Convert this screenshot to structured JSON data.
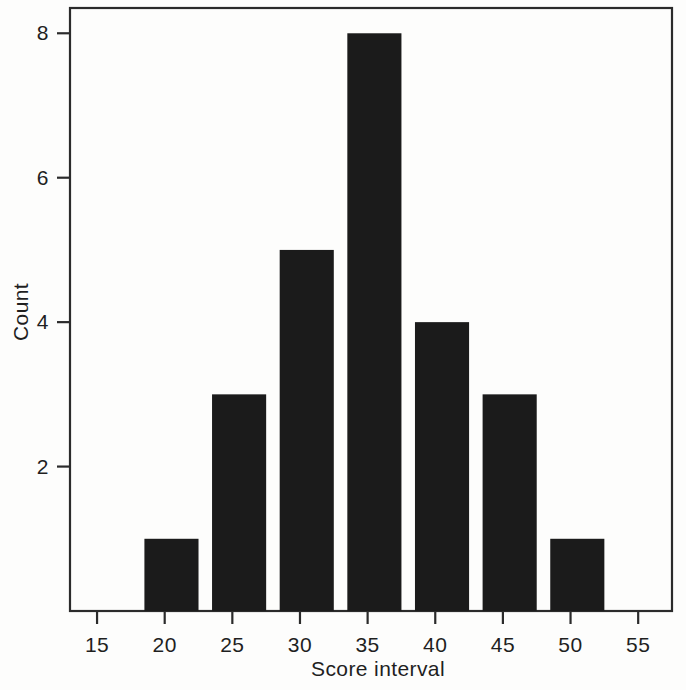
{
  "chart_data": {
    "type": "bar",
    "title": "",
    "subtitle": "",
    "xlabel": "Score interval",
    "ylabel": "Count",
    "categories": [
      "18.5-22.5",
      "23.5-27.5",
      "28.5-32.5",
      "33.5-37.5",
      "38.5-42.5",
      "43.5-47.5",
      "48.5-52.5"
    ],
    "bin_centers": [
      20.5,
      25.5,
      30.5,
      35.5,
      40.5,
      45.5,
      50.5
    ],
    "bin_edges": [
      [
        18.5,
        22.5
      ],
      [
        23.5,
        27.5
      ],
      [
        28.5,
        32.5
      ],
      [
        33.5,
        37.5
      ],
      [
        38.5,
        42.5
      ],
      [
        43.5,
        47.5
      ],
      [
        48.5,
        52.5
      ]
    ],
    "values": [
      1,
      3,
      5,
      8,
      4,
      3,
      1
    ],
    "xlim": [
      13.0,
      57.5
    ],
    "ylim": [
      0,
      8.35
    ],
    "xticks": [
      15,
      20,
      25,
      30,
      35,
      40,
      45,
      50,
      55
    ],
    "xtick_labels": [
      "15",
      "20",
      "25",
      "30",
      "35",
      "40",
      "45",
      "50",
      "55"
    ],
    "yticks": [
      2,
      4,
      6,
      8
    ],
    "ytick_labels": [
      "2",
      "4",
      "6",
      "8"
    ],
    "grid": false,
    "legend": null,
    "legend_position": "none",
    "bar_color": "#1b1b1b",
    "frame_color": "#2b2b2b",
    "background_color": "#fdfdfc",
    "total_count": 25,
    "annotations": []
  },
  "axes": {
    "x_axis_title": "Score interval",
    "y_axis_title": "Count"
  }
}
